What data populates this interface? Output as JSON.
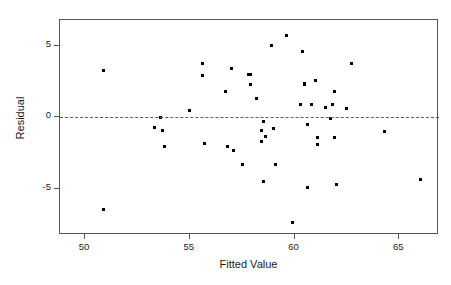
{
  "chart_data": {
    "type": "scatter",
    "title": "",
    "xlabel": "Fitted Value",
    "ylabel": "Residual",
    "xlim": [
      48.8,
      66.9
    ],
    "ylim": [
      -8.2,
      6.8
    ],
    "xticks": [
      50,
      55,
      60,
      65
    ],
    "yticks": [
      5,
      0,
      -5
    ],
    "xtick_labels": [
      "50",
      "55",
      "60",
      "65"
    ],
    "ytick_labels": [
      "5",
      "0",
      "-5"
    ],
    "grid": false,
    "legend": null,
    "reference_lines": [
      {
        "name": "zero-residual-line",
        "orientation": "horizontal",
        "y": 0,
        "style": "dashed"
      }
    ],
    "marker": {
      "shape": "square",
      "color": "#000000",
      "size_px": 3
    },
    "n_points": 57,
    "points": [
      {
        "x": 50.9,
        "y": 3.3
      },
      {
        "x": 50.9,
        "y": -6.4
      },
      {
        "x": 53.3,
        "y": -0.7
      },
      {
        "x": 53.6,
        "y": 0.0
      },
      {
        "x": 53.7,
        "y": -0.9
      },
      {
        "x": 53.8,
        "y": -2.0
      },
      {
        "x": 55.0,
        "y": 0.5
      },
      {
        "x": 55.6,
        "y": 3.8
      },
      {
        "x": 55.6,
        "y": 2.9
      },
      {
        "x": 55.7,
        "y": -1.8
      },
      {
        "x": 56.7,
        "y": 1.8
      },
      {
        "x": 56.8,
        "y": -2.0
      },
      {
        "x": 57.0,
        "y": 3.4
      },
      {
        "x": 57.1,
        "y": -2.3
      },
      {
        "x": 57.5,
        "y": -3.3
      },
      {
        "x": 57.8,
        "y": 3.0
      },
      {
        "x": 57.9,
        "y": 3.0
      },
      {
        "x": 57.9,
        "y": 2.3
      },
      {
        "x": 58.2,
        "y": 1.3
      },
      {
        "x": 58.4,
        "y": -0.9
      },
      {
        "x": 58.4,
        "y": -1.7
      },
      {
        "x": 58.5,
        "y": -0.3
      },
      {
        "x": 58.5,
        "y": -4.5
      },
      {
        "x": 58.6,
        "y": -1.3
      },
      {
        "x": 58.9,
        "y": 5.0
      },
      {
        "x": 59.0,
        "y": -0.8
      },
      {
        "x": 59.1,
        "y": -3.3
      },
      {
        "x": 59.6,
        "y": 5.7
      },
      {
        "x": 59.9,
        "y": -7.3
      },
      {
        "x": 60.3,
        "y": 0.9
      },
      {
        "x": 60.4,
        "y": 4.6
      },
      {
        "x": 60.5,
        "y": 2.3
      },
      {
        "x": 60.5,
        "y": 2.4
      },
      {
        "x": 60.6,
        "y": -0.5
      },
      {
        "x": 60.6,
        "y": -4.9
      },
      {
        "x": 60.8,
        "y": 0.9
      },
      {
        "x": 61.0,
        "y": 2.6
      },
      {
        "x": 61.1,
        "y": -1.4
      },
      {
        "x": 61.1,
        "y": -1.9
      },
      {
        "x": 61.5,
        "y": 0.7
      },
      {
        "x": 61.7,
        "y": -0.1
      },
      {
        "x": 61.8,
        "y": 0.9
      },
      {
        "x": 61.9,
        "y": 1.8
      },
      {
        "x": 61.9,
        "y": -1.4
      },
      {
        "x": 62.0,
        "y": -4.7
      },
      {
        "x": 62.5,
        "y": 0.6
      },
      {
        "x": 62.7,
        "y": 3.8
      },
      {
        "x": 64.3,
        "y": -1.0
      },
      {
        "x": 66.0,
        "y": -4.3
      }
    ]
  },
  "figure": {
    "title": "",
    "background": "#ffffff",
    "frame_color": "#555555",
    "point_color": "#000000"
  }
}
